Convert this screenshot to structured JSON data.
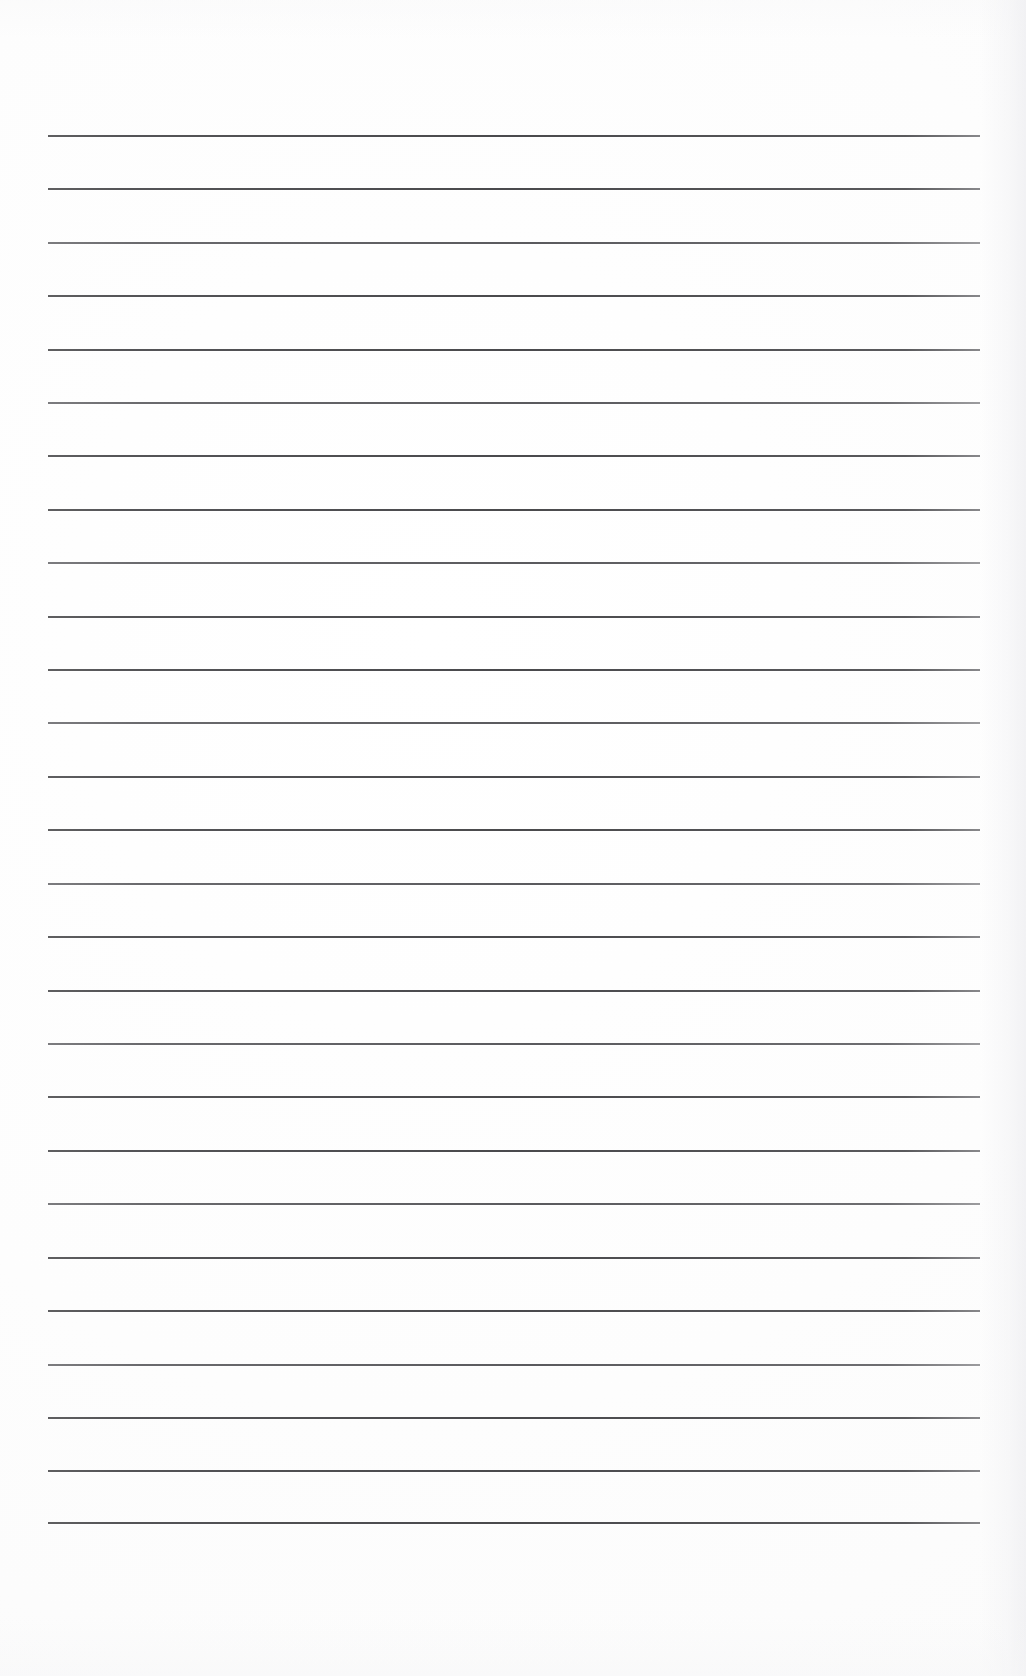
{
  "document": {
    "kind": "scanned-blank-ruled-page",
    "title": "Blank Ruled Page",
    "paper_color": "#fefefe",
    "rule_color": "#46464a",
    "body_text": "",
    "handwriting": "",
    "page_number": "",
    "header_text": "",
    "footer_text": ""
  },
  "layout": {
    "page_width": 1026,
    "page_height": 1676,
    "rule_left": 48,
    "rule_right": 980,
    "rule_width": 932,
    "first_rule_y": 136,
    "last_rule_y": 1523,
    "rule_spacing": 53.35,
    "rule_thickness": 2,
    "rule_count": 27,
    "top_margin": 136,
    "bottom_margin": 153,
    "left_margin": 48,
    "right_margin": 46
  },
  "rules": [
    {
      "index": 1,
      "y": 136,
      "weight": "normal"
    },
    {
      "index": 2,
      "y": 189,
      "weight": "normal"
    },
    {
      "index": 3,
      "y": 243,
      "weight": "light"
    },
    {
      "index": 4,
      "y": 296,
      "weight": "normal"
    },
    {
      "index": 5,
      "y": 350,
      "weight": "normal"
    },
    {
      "index": 6,
      "y": 403,
      "weight": "light"
    },
    {
      "index": 7,
      "y": 456,
      "weight": "normal"
    },
    {
      "index": 8,
      "y": 510,
      "weight": "normal"
    },
    {
      "index": 9,
      "y": 563,
      "weight": "light"
    },
    {
      "index": 10,
      "y": 617,
      "weight": "normal"
    },
    {
      "index": 11,
      "y": 670,
      "weight": "normal"
    },
    {
      "index": 12,
      "y": 723,
      "weight": "light"
    },
    {
      "index": 13,
      "y": 777,
      "weight": "normal"
    },
    {
      "index": 14,
      "y": 830,
      "weight": "normal"
    },
    {
      "index": 15,
      "y": 884,
      "weight": "light"
    },
    {
      "index": 16,
      "y": 937,
      "weight": "normal"
    },
    {
      "index": 17,
      "y": 991,
      "weight": "normal"
    },
    {
      "index": 18,
      "y": 1044,
      "weight": "light"
    },
    {
      "index": 19,
      "y": 1097,
      "weight": "normal"
    },
    {
      "index": 20,
      "y": 1151,
      "weight": "normal"
    },
    {
      "index": 21,
      "y": 1204,
      "weight": "light"
    },
    {
      "index": 22,
      "y": 1258,
      "weight": "normal"
    },
    {
      "index": 23,
      "y": 1311,
      "weight": "normal"
    },
    {
      "index": 24,
      "y": 1365,
      "weight": "light"
    },
    {
      "index": 25,
      "y": 1418,
      "weight": "normal"
    },
    {
      "index": 26,
      "y": 1471,
      "weight": "normal"
    },
    {
      "index": 27,
      "y": 1523,
      "weight": "normal"
    }
  ]
}
